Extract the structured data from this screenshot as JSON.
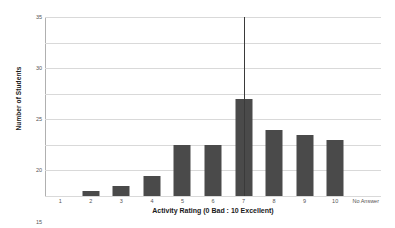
{
  "chart_data": {
    "type": "bar",
    "title": "",
    "xlabel": "Activity Rating (0 Bad : 10 Excellent)",
    "ylabel": "Number of Students",
    "categories": [
      "1",
      "2",
      "3",
      "4",
      "5",
      "6",
      "7",
      "8",
      "9",
      "10",
      "No Answer"
    ],
    "values": [
      0,
      1,
      2,
      4,
      10,
      10,
      19,
      13,
      12,
      11,
      0
    ],
    "ylim": [
      0,
      35
    ],
    "ytick_values": [
      0,
      5,
      10,
      15,
      20,
      25,
      30,
      35
    ],
    "ytick_labels": [
      "0",
      "5",
      "10",
      "15",
      "20",
      "25",
      "30",
      "35"
    ],
    "grid": true,
    "legend": false,
    "bar_color": "#4a4a4a",
    "gridline_color": "#d9d9d9",
    "background_color": "#ffffff",
    "annotations": [
      {
        "type": "vertical-line",
        "category": "7",
        "y_from": 0,
        "y_to": 35,
        "color": "#3a3a3a"
      }
    ]
  }
}
